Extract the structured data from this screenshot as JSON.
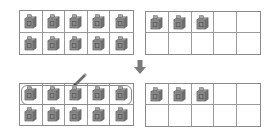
{
  "diagram": {
    "colors": {
      "cube_fill": "#8c8c8c",
      "cube_side": "#6f6f6f",
      "cube_top": "#a8a8a8",
      "frame_border": "#8a8a8a",
      "arrow": "#7a7a7a"
    },
    "before": {
      "left_frame": {
        "filled": 10,
        "capacity": 10
      },
      "right_frame": {
        "filled": 3,
        "capacity": 10
      }
    },
    "after": {
      "left_frame": {
        "filled": 10,
        "capacity": 10,
        "circled_row": 1
      },
      "right_frame": {
        "filled": 3,
        "capacity": 10
      }
    },
    "icons": {
      "arrow": "arrow-down-icon",
      "pencil": "pencil-icon",
      "cube": "cube-icon"
    }
  }
}
